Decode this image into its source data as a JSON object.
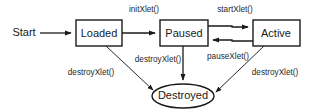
{
  "diagram": {
    "type": "state-machine",
    "start_label": "Start",
    "colors": {
      "stroke": "#1a1a1a",
      "fill": "#ffffff",
      "text": "#1a1a1a",
      "background": "#ffffff"
    },
    "nodes": [
      {
        "id": "loaded",
        "label": "Loaded",
        "shape": "rectangle",
        "x": 76,
        "y": 20,
        "w": 46,
        "h": 26
      },
      {
        "id": "paused",
        "label": "Paused",
        "shape": "rectangle",
        "x": 160,
        "y": 20,
        "w": 48,
        "h": 26
      },
      {
        "id": "active",
        "label": "Active",
        "shape": "rectangle",
        "x": 253,
        "y": 20,
        "w": 47,
        "h": 26
      },
      {
        "id": "destroyed",
        "label": "Destroyed",
        "shape": "ellipse",
        "cx": 183,
        "cy": 96,
        "rx": 31,
        "ry": 12
      }
    ],
    "edges": [
      {
        "id": "start-to-loaded",
        "from": "start",
        "to": "loaded",
        "label": ""
      },
      {
        "id": "loaded-to-paused",
        "from": "loaded",
        "to": "paused",
        "label": "initXlet()"
      },
      {
        "id": "paused-to-active",
        "from": "paused",
        "to": "active",
        "label": "startXlet()"
      },
      {
        "id": "active-to-paused",
        "from": "active",
        "to": "paused",
        "label": "pauseXlet()"
      },
      {
        "id": "loaded-to-destroyed",
        "from": "loaded",
        "to": "destroyed",
        "label": "destroyXlet()"
      },
      {
        "id": "paused-to-destroyed",
        "from": "paused",
        "to": "destroyed",
        "label": "destroyXlet()"
      },
      {
        "id": "active-to-destroyed",
        "from": "active",
        "to": "destroyed",
        "label": "destroyXlet()"
      }
    ],
    "labels": {
      "init_xlet": "initXlet()",
      "start_xlet": "startXlet()",
      "pause_xlet": "pauseXlet()",
      "destroy_xlet_left": "destroyXlet()",
      "destroy_xlet_mid": "destroyXlet()",
      "destroy_xlet_right": "destroyXlet()"
    }
  }
}
